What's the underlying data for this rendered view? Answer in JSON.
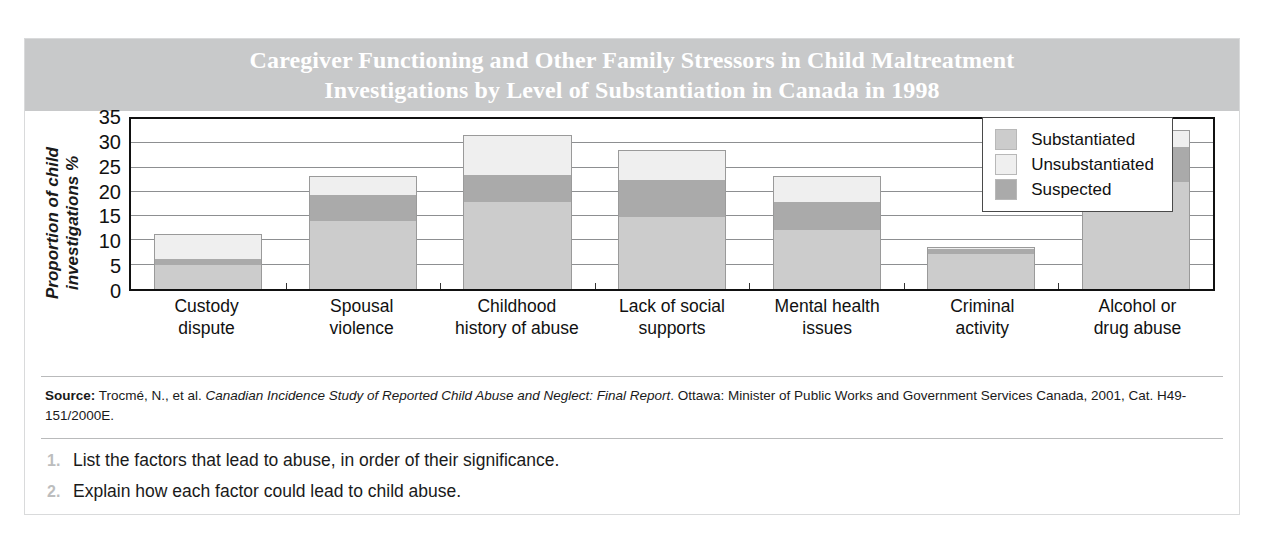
{
  "title": {
    "line1": "Caregiver Functioning and Other Family Stressors in Child Maltreatment",
    "line2": "Investigations by Level of Substantiation in Canada in 1998"
  },
  "ylabel_line1": "Proportion of child",
  "ylabel_line2": "investigations %",
  "legend": {
    "items": [
      {
        "label": "Substantiated",
        "color": "#cccccc"
      },
      {
        "label": "Unsubstantiated",
        "color": "#efefef"
      },
      {
        "label": "Suspected",
        "color": "#aaaaaa"
      }
    ]
  },
  "source": {
    "label": "Source:",
    "part1": " Trocmé, N., et al. ",
    "italic1": "Canadian Incidence Study of Reported Child Abuse and Neglect: Final Report",
    "part2": ". Ottawa: Minister of Public Works and Government Services Canada, 2001, Cat. H49-151/2000E."
  },
  "questions": [
    {
      "num": "1.",
      "text": "List the factors that lead to abuse, in order of their significance."
    },
    {
      "num": "2.",
      "text": "Explain how each factor could lead to child abuse."
    }
  ],
  "chart_data": {
    "type": "bar",
    "stacked": true,
    "title": "Caregiver Functioning and Other Family Stressors in Child Maltreatment Investigations by Level of Substantiation in Canada in 1998",
    "xlabel": "",
    "ylabel": "Proportion of child investigations %",
    "ylim": [
      0,
      35
    ],
    "yticks": [
      0,
      5,
      10,
      15,
      20,
      25,
      30,
      35
    ],
    "grid": true,
    "legend_position": "top-right inside plot",
    "categories": [
      "Custody dispute",
      "Spousal violence",
      "Childhood history of abuse",
      "Lack of social supports",
      "Mental health issues",
      "Criminal activity",
      "Alcohol or drug abuse"
    ],
    "category_lines": [
      [
        "Custody",
        "dispute"
      ],
      [
        "Spousal",
        "violence"
      ],
      [
        "Childhood",
        "history of abuse"
      ],
      [
        "Lack of social",
        "supports"
      ],
      [
        "Mental health",
        "issues"
      ],
      [
        "Criminal",
        "activity"
      ],
      [
        "Alcohol or",
        "drug abuse"
      ]
    ],
    "series": [
      {
        "name": "Substantiated",
        "color": "#cccccc",
        "values": [
          4.8,
          13.7,
          17.5,
          14.5,
          11.8,
          7.0,
          21.5
        ]
      },
      {
        "name": "Suspected",
        "color": "#aaaaaa",
        "values": [
          1.2,
          5.3,
          5.5,
          7.5,
          5.7,
          1.0,
          7.0
        ]
      },
      {
        "name": "Unsubstantiated",
        "color": "#efefef",
        "values": [
          5.0,
          3.7,
          8.0,
          6.0,
          5.2,
          0.5,
          3.5
        ]
      }
    ],
    "stack_order_bottom_to_top": [
      "Substantiated",
      "Suspected",
      "Unsubstantiated"
    ],
    "totals": [
      11.0,
      22.7,
      31.0,
      28.0,
      22.7,
      8.5,
      32.0
    ]
  }
}
